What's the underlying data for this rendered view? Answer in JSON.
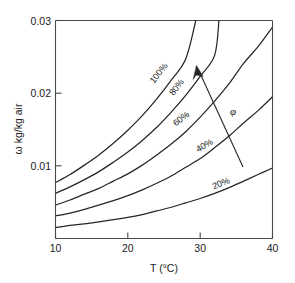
{
  "chart_data": {
    "type": "line",
    "title": "",
    "subtitle": "",
    "xlabel": "T (°C)",
    "ylabel": "ω kg/kg air",
    "xlim": [
      10,
      40
    ],
    "ylim": [
      0,
      0.03
    ],
    "xticks": [
      10,
      20,
      30,
      40
    ],
    "xtick_labels": [
      "10",
      "20",
      "30",
      "40"
    ],
    "yticks": [
      0.01,
      0.02,
      0.03
    ],
    "ytick_labels": [
      "0.01",
      "0.02",
      "0.03"
    ],
    "grid": false,
    "legend": "none",
    "annotations": [
      {
        "name": "phi-symbol",
        "text": "φ",
        "x": 34.5,
        "y": 0.0185
      },
      {
        "name": "increasing-rh-arrow",
        "text": "",
        "from": [
          37.8,
          0.0098
        ],
        "to": [
          29.6,
          0.0244
        ]
      }
    ],
    "series": [
      {
        "name": "100%",
        "label": "100%",
        "rh": 100,
        "x": [
          10,
          12,
          14,
          16,
          18,
          20,
          22,
          24,
          26,
          28,
          29.4
        ],
        "values": [
          0.0077,
          0.0088,
          0.0101,
          0.0115,
          0.0131,
          0.0149,
          0.0169,
          0.0192,
          0.0218,
          0.0247,
          0.03
        ]
      },
      {
        "name": "80%",
        "label": "80%",
        "rh": 80,
        "x": [
          10,
          12,
          14,
          16,
          18,
          20,
          22,
          24,
          26,
          28,
          30,
          32,
          32.6
        ],
        "values": [
          0.0062,
          0.0071,
          0.0081,
          0.0092,
          0.0105,
          0.0119,
          0.0135,
          0.0153,
          0.0174,
          0.0197,
          0.0223,
          0.0252,
          0.03
        ]
      },
      {
        "name": "60%",
        "label": "60%",
        "rh": 60,
        "x": [
          10,
          12,
          14,
          16,
          18,
          20,
          22,
          24,
          26,
          28,
          30,
          32,
          34,
          36,
          38,
          40
        ],
        "values": [
          0.0046,
          0.0053,
          0.0061,
          0.0069,
          0.0079,
          0.0089,
          0.0101,
          0.0115,
          0.013,
          0.0147,
          0.0167,
          0.0189,
          0.0213,
          0.0241,
          0.0264,
          0.0291
        ]
      },
      {
        "name": "40%",
        "label": "40%",
        "rh": 40,
        "x": [
          10,
          12,
          14,
          16,
          18,
          20,
          22,
          24,
          26,
          28,
          30,
          32,
          34,
          36,
          38,
          40
        ],
        "values": [
          0.0031,
          0.0035,
          0.004,
          0.0046,
          0.0052,
          0.0059,
          0.0067,
          0.0076,
          0.0086,
          0.0098,
          0.011,
          0.0125,
          0.0141,
          0.0159,
          0.0176,
          0.0195
        ]
      },
      {
        "name": "20%",
        "label": "20%",
        "rh": 20,
        "x": [
          10,
          12,
          14,
          16,
          18,
          20,
          22,
          24,
          26,
          28,
          30,
          32,
          34,
          36,
          38,
          40
        ],
        "values": [
          0.0015,
          0.0018,
          0.002,
          0.0023,
          0.0026,
          0.0029,
          0.0033,
          0.0038,
          0.0043,
          0.0049,
          0.0055,
          0.0062,
          0.007,
          0.0079,
          0.0088,
          0.0097
        ]
      }
    ],
    "curve_labels": [
      {
        "text": "100%",
        "x": 161,
        "y": 75,
        "rotate": -52
      },
      {
        "text": "80%",
        "x": 179,
        "y": 89,
        "rotate": -52
      },
      {
        "text": "60%",
        "x": 183,
        "y": 121,
        "rotate": -38
      },
      {
        "text": "40%",
        "x": 206,
        "y": 148,
        "rotate": -30
      },
      {
        "text": "20%",
        "x": 222,
        "y": 186,
        "rotate": -22
      }
    ],
    "colors": {
      "curve": "#262626",
      "axis": "#4a4a4a",
      "text": "#1a1a1a",
      "background": "#ffffff"
    }
  }
}
